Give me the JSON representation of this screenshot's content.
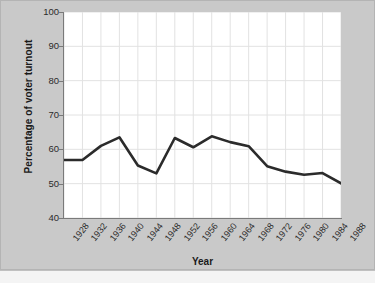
{
  "chart_data": {
    "type": "line",
    "title": "",
    "xlabel": "Year",
    "ylabel": "Percentage of voter turnout",
    "xlim": [
      1928,
      1988
    ],
    "ylim": [
      40,
      100
    ],
    "grid": true,
    "legend": "none",
    "line_color": "#2b2b2b",
    "plot_background": "#ffffff",
    "figure_background": "#c9c9c9",
    "gridline_color": "#e2e2e2",
    "axis_color": "#7a7a7a",
    "ytick_labels": [
      "100",
      "90",
      "80",
      "70",
      "60",
      "50",
      "40"
    ],
    "ytick_values": [
      100,
      90,
      80,
      70,
      60,
      50,
      40
    ],
    "categories": [
      "1928",
      "1932",
      "1936",
      "1940",
      "1944",
      "1948",
      "1952",
      "1956",
      "1960",
      "1964",
      "1968",
      "1972",
      "1976",
      "1980",
      "1984",
      "1988"
    ],
    "x": [
      1928,
      1932,
      1936,
      1940,
      1944,
      1948,
      1952,
      1956,
      1960,
      1964,
      1968,
      1972,
      1976,
      1980,
      1984,
      1988
    ],
    "values": [
      56.9,
      56.9,
      61.0,
      63.5,
      55.3,
      53.0,
      63.3,
      60.6,
      63.8,
      62.1,
      60.9,
      55.1,
      53.5,
      52.6,
      53.1,
      50.1
    ],
    "series": [
      {
        "name": "Percentage of voter turnout",
        "values": [
          56.9,
          56.9,
          61.0,
          63.5,
          55.3,
          53.0,
          63.3,
          60.6,
          63.8,
          62.1,
          60.9,
          55.1,
          53.5,
          52.6,
          53.1,
          50.1
        ]
      }
    ]
  }
}
